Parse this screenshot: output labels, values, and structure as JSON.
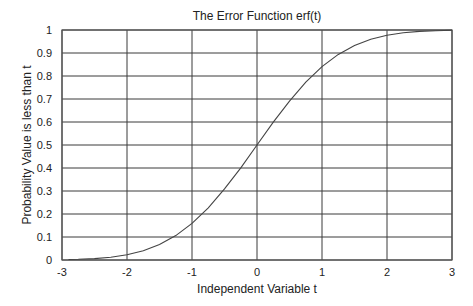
{
  "chart_data": {
    "type": "line",
    "title": "The Error Function erf(t)",
    "xlabel": "Independent Variable t",
    "ylabel": "Probability  Value is less than t",
    "xlim": [
      -3,
      3
    ],
    "ylim": [
      0,
      1
    ],
    "grid": true,
    "legend": null,
    "x_ticks": [
      "-3",
      "-2",
      "-1",
      "0",
      "1",
      "2",
      "3"
    ],
    "y_ticks": [
      "0",
      "0.1",
      "0.2",
      "0.3",
      "0.4",
      "0.5",
      "0.6",
      "0.7",
      "0.8",
      "0.9",
      "1"
    ],
    "series": [
      {
        "name": "erf(t)",
        "x": [
          -2.9,
          -2.75,
          -2.5,
          -2.25,
          -2.0,
          -1.75,
          -1.5,
          -1.25,
          -1.0,
          -0.75,
          -0.5,
          -0.25,
          0.0,
          0.25,
          0.5,
          0.75,
          1.0,
          1.25,
          1.5,
          1.75,
          2.0,
          2.25,
          2.5,
          2.75,
          3.0
        ],
        "y": [
          0.002,
          0.003,
          0.006,
          0.012,
          0.023,
          0.04,
          0.067,
          0.106,
          0.159,
          0.227,
          0.309,
          0.401,
          0.5,
          0.599,
          0.691,
          0.773,
          0.841,
          0.894,
          0.933,
          0.96,
          0.977,
          0.988,
          0.994,
          0.997,
          0.999
        ]
      }
    ]
  }
}
